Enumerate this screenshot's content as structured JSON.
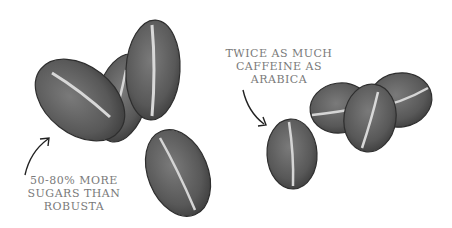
{
  "illustration": {
    "subject": "coffee beans comparison",
    "left_group": {
      "name": "arabica beans",
      "bean_count": 4,
      "caption_lines": [
        "50-80% MORE",
        "SUGARS THAN",
        "ROBUSTA"
      ]
    },
    "right_group": {
      "name": "robusta beans",
      "bean_count": 4,
      "caption_lines": [
        "TWICE AS MUCH",
        "CAFFEINE AS",
        "ARABICA"
      ]
    },
    "colors": {
      "bean_fill": "#5e5e5e",
      "bean_dark": "#3f3f3f",
      "crease": "#d8d8d8",
      "text": "#7a7a7a",
      "arrow": "#222222"
    }
  }
}
